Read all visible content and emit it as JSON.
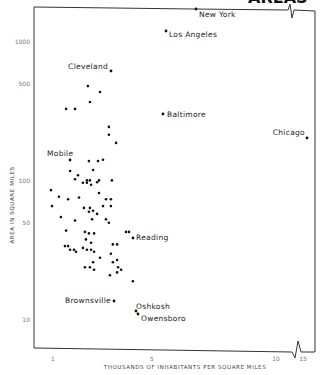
{
  "chart_data": {
    "type": "scatter",
    "title": "AREAS",
    "xlabel": "THOUSANDS OF INHABITANTS PER SQUARE MILES",
    "ylabel": "AREA IN SQUARE MILES",
    "x_scale": "linear",
    "y_scale": "log",
    "x_ticks": [
      {
        "value": 1,
        "label": "1"
      },
      {
        "value": 5,
        "label": "5"
      },
      {
        "value": 10,
        "label": "10"
      },
      {
        "value": 15,
        "label": "15"
      }
    ],
    "y_ticks": [
      {
        "value": 1000,
        "label": "1000"
      },
      {
        "value": 500,
        "label": "500"
      },
      {
        "value": 100,
        "label": "100"
      },
      {
        "value": 50,
        "label": "50"
      },
      {
        "value": 10,
        "label": "10"
      }
    ],
    "axis_break": {
      "x_between": [
        10,
        15
      ]
    },
    "xlim": [
      0.9,
      16
    ],
    "ylim": [
      8,
      1800
    ],
    "grid": false,
    "labeled_points": [
      {
        "name": "New York",
        "x": 6.8,
        "y": 1730
      },
      {
        "name": "Los Angeles",
        "x": 5.57,
        "y": 1200
      },
      {
        "name": "Cleveland",
        "x": 3.34,
        "y": 618
      },
      {
        "name": "Baltimore",
        "x": 5.44,
        "y": 303
      },
      {
        "name": "Chicago",
        "x": 16,
        "y": 204
      },
      {
        "name": "Mobile",
        "x": 1.69,
        "y": 142
      },
      {
        "name": "Reading",
        "x": 4.23,
        "y": 40
      },
      {
        "name": "Brownsville",
        "x": 3.46,
        "y": 13.7
      },
      {
        "name": "Oshkosh",
        "x": 4.31,
        "y": 11.6
      },
      {
        "name": "Owensboro",
        "x": 4.39,
        "y": 11.3
      }
    ],
    "points": [
      [
        2.41,
        482
      ],
      [
        2.9,
        437
      ],
      [
        2.49,
        370
      ],
      [
        1.53,
        330
      ],
      [
        1.89,
        330
      ],
      [
        3.26,
        245
      ],
      [
        3.26,
        215
      ],
      [
        3.55,
        188
      ],
      [
        2.45,
        139
      ],
      [
        2.82,
        139
      ],
      [
        3.02,
        142
      ],
      [
        1.69,
        118
      ],
      [
        2.62,
        120
      ],
      [
        2.01,
        110
      ],
      [
        1.89,
        103
      ],
      [
        2.21,
        97
      ],
      [
        2.37,
        101
      ],
      [
        2.49,
        101
      ],
      [
        2.37,
        97
      ],
      [
        2.54,
        94
      ],
      [
        2.78,
        98
      ],
      [
        2.86,
        101
      ],
      [
        3.38,
        101
      ],
      [
        0.92,
        86
      ],
      [
        2.86,
        82
      ],
      [
        1.24,
        77
      ],
      [
        1.61,
        74
      ],
      [
        2.05,
        76
      ],
      [
        3.14,
        74
      ],
      [
        3.34,
        74
      ],
      [
        0.96,
        66
      ],
      [
        2.25,
        64
      ],
      [
        2.49,
        64
      ],
      [
        2.62,
        61
      ],
      [
        2.45,
        60
      ],
      [
        2.78,
        58
      ],
      [
        3.02,
        66
      ],
      [
        3.34,
        66
      ],
      [
        3.14,
        53
      ],
      [
        3.26,
        50
      ],
      [
        1.32,
        55
      ],
      [
        1.89,
        52
      ],
      [
        2.58,
        53
      ],
      [
        1.53,
        44
      ],
      [
        2.29,
        43
      ],
      [
        2.45,
        42
      ],
      [
        2.66,
        42
      ],
      [
        3.95,
        43
      ],
      [
        4.07,
        43
      ],
      [
        2.33,
        38
      ],
      [
        2.54,
        36
      ],
      [
        1.48,
        34
      ],
      [
        1.61,
        34
      ],
      [
        1.69,
        32
      ],
      [
        1.85,
        32
      ],
      [
        1.93,
        31
      ],
      [
        2.21,
        33
      ],
      [
        2.37,
        32
      ],
      [
        2.54,
        32
      ],
      [
        2.66,
        31
      ],
      [
        3.42,
        35
      ],
      [
        3.59,
        35
      ],
      [
        3.34,
        30
      ],
      [
        2.62,
        26
      ],
      [
        2.9,
        28
      ],
      [
        3.42,
        26
      ],
      [
        3.59,
        27
      ],
      [
        2.29,
        24
      ],
      [
        2.49,
        24
      ],
      [
        2.66,
        23
      ],
      [
        3.63,
        24
      ],
      [
        3.75,
        23
      ],
      [
        3.59,
        22
      ],
      [
        3.3,
        21
      ],
      [
        4.23,
        19
      ]
    ]
  },
  "header": {
    "partial_title": "AREAS"
  }
}
